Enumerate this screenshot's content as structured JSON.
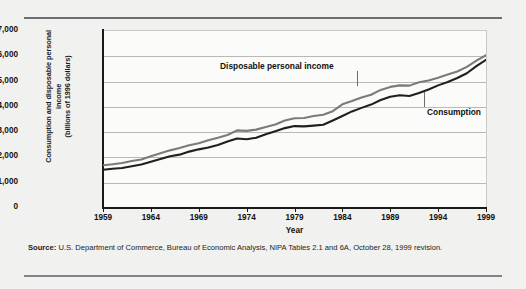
{
  "figure": {
    "source_label": "Source:",
    "source_text": "U.S. Department of Commerce, Bureau of Economic Analysis, NIPA Tables 2.1 and 6A, October 28, 1999 revision."
  },
  "chart_data": {
    "type": "line",
    "title": "",
    "xlabel": "Year",
    "ylabel": "Consumption and disposable personal income (billions of 1996 dollars)",
    "ylabel_line1": "Consumption and disposable personal income",
    "ylabel_line2": "(billions of 1996 dollars)",
    "grid": true,
    "legend_position": "inline-annotations",
    "xlim": [
      1959,
      1999
    ],
    "ylim": [
      0,
      7000
    ],
    "ytick_labels": [
      "$7,000",
      "6,000",
      "5,000",
      "4,000",
      "3,000",
      "2,000",
      "1,000",
      "0"
    ],
    "ytick_values": [
      7000,
      6000,
      5000,
      4000,
      3000,
      2000,
      1000,
      0
    ],
    "xtick_labels": [
      "1959",
      "1964",
      "1969",
      "1974",
      "1979",
      "1984",
      "1989",
      "1994",
      "1999"
    ],
    "xtick_values": [
      1959,
      1964,
      1969,
      1974,
      1979,
      1984,
      1989,
      1994,
      1999
    ],
    "annotations": [
      {
        "name": "disposable-personal-income-label",
        "text": "Disposable personal income"
      },
      {
        "name": "consumption-label",
        "text": "Consumption"
      }
    ],
    "x": [
      1959,
      1960,
      1961,
      1962,
      1963,
      1964,
      1965,
      1966,
      1967,
      1968,
      1969,
      1970,
      1971,
      1972,
      1973,
      1974,
      1975,
      1976,
      1977,
      1978,
      1979,
      1980,
      1981,
      1982,
      1983,
      1984,
      1985,
      1986,
      1987,
      1988,
      1989,
      1990,
      1991,
      1992,
      1993,
      1994,
      1995,
      1996,
      1997,
      1998,
      1999
    ],
    "series": [
      {
        "name": "Disposable personal income",
        "color": "#7b7b7b",
        "values": [
          1650,
          1690,
          1740,
          1820,
          1880,
          2010,
          2130,
          2240,
          2330,
          2440,
          2520,
          2640,
          2740,
          2850,
          3030,
          3010,
          3060,
          3160,
          3260,
          3420,
          3510,
          3520,
          3600,
          3650,
          3790,
          4060,
          4190,
          4330,
          4440,
          4630,
          4750,
          4810,
          4800,
          4930,
          5000,
          5110,
          5240,
          5360,
          5540,
          5790,
          6000
        ],
        "final_value_note": "~6,300 at 1999 (line terminus)"
      },
      {
        "name": "Consumption",
        "color": "#1f1f1f",
        "values": [
          1470,
          1510,
          1540,
          1610,
          1680,
          1790,
          1900,
          2010,
          2070,
          2190,
          2280,
          2350,
          2450,
          2590,
          2710,
          2680,
          2740,
          2880,
          3000,
          3120,
          3200,
          3190,
          3220,
          3250,
          3420,
          3600,
          3780,
          3920,
          4050,
          4230,
          4360,
          4420,
          4390,
          4510,
          4650,
          4810,
          4940,
          5100,
          5290,
          5570,
          5820
        ]
      }
    ]
  }
}
